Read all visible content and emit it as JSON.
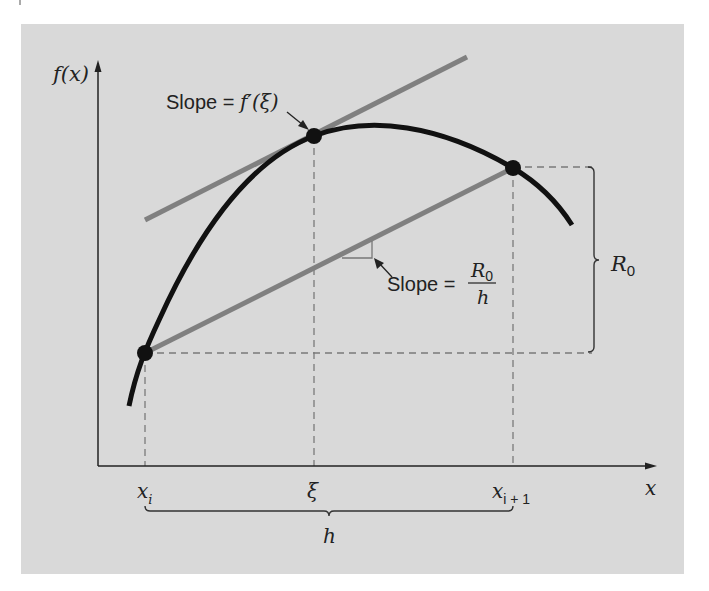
{
  "figure": {
    "panel_color": "#d9d9d9",
    "curve_color": "#111111",
    "line_color": "#808080",
    "dash_color": "#7a7a7a",
    "axis_color": "#222222"
  },
  "axes": {
    "y_label": "f(x)",
    "x_label": "x"
  },
  "points": [
    {
      "name": "x_i",
      "label": "x",
      "sub": "i"
    },
    {
      "name": "xi",
      "label": "ξ",
      "sub": ""
    },
    {
      "name": "x_i_plus_1",
      "label": "x",
      "sub": "i + 1"
    }
  ],
  "annotations": {
    "tangent_slope": {
      "prefix": "Slope = ",
      "expr": "f′(ξ)"
    },
    "secant_slope": {
      "prefix": "Slope =",
      "numerator": "R",
      "numerator_sub": "0",
      "denominator": "h"
    },
    "r0_brace": {
      "label": "R",
      "sub": "0"
    },
    "h_brace": {
      "label": "h"
    }
  }
}
